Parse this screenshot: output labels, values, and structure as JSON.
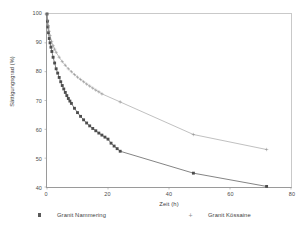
{
  "chart_data": {
    "type": "line",
    "title": "",
    "xlabel": "Zeit (h)",
    "ylabel": "Sättigungsgrad (%)",
    "xlim": [
      0,
      80
    ],
    "ylim": [
      40,
      100
    ],
    "xticks": [
      "0",
      "20",
      "40",
      "60",
      "80"
    ],
    "yticks": [
      "100",
      "90",
      "80",
      "70",
      "60",
      "50",
      "40"
    ],
    "grid": false,
    "legend_position": "below",
    "series": [
      {
        "name": "Granit Nammering",
        "marker": "filled-square",
        "color": "#4d4d4d",
        "x": [
          0,
          0.15,
          0.3,
          0.5,
          0.75,
          1,
          1.3,
          1.6,
          2,
          2.5,
          3,
          3.5,
          4,
          4.5,
          5,
          5.5,
          6,
          6.5,
          7,
          7.5,
          8,
          9,
          10,
          11,
          12,
          13,
          14,
          15,
          16,
          17,
          18,
          19,
          20,
          21,
          22,
          23,
          24,
          48,
          72
        ],
        "y": [
          100,
          97.5,
          95.5,
          93.5,
          91.5,
          90,
          88.5,
          87,
          85,
          83,
          81,
          79.5,
          78,
          76.5,
          75.2,
          74,
          72.8,
          71.7,
          70.7,
          69.8,
          69,
          67.3,
          65.8,
          64.5,
          63.3,
          62.2,
          61.2,
          60.3,
          59.5,
          58.7,
          58,
          57.3,
          56.6,
          55.2,
          54.2,
          53.3,
          52.4,
          44.8,
          40.2
        ]
      },
      {
        "name": "Granit Kössaine",
        "marker": "plus",
        "color": "#8a8a8a",
        "x": [
          0,
          0.2,
          0.4,
          0.7,
          1,
          1.5,
          2,
          2.5,
          3,
          4,
          5,
          6,
          7,
          8,
          9,
          10,
          11,
          12,
          13,
          14,
          15,
          16,
          17,
          18,
          24,
          48,
          72
        ],
        "y": [
          100,
          97.8,
          96,
          94,
          92.5,
          90.5,
          89,
          87.8,
          86.7,
          85,
          83.5,
          82.2,
          81,
          80,
          79,
          78.1,
          77.3,
          76.5,
          75.7,
          75,
          74.3,
          73.6,
          73,
          72.3,
          69.5,
          58.2,
          53.0
        ]
      }
    ]
  },
  "legend": {
    "entries": [
      {
        "label": "Granit Nammering",
        "marker_icon": "filled-square-marker"
      },
      {
        "label": "Granit Kössaine",
        "marker_icon": "plus-marker"
      }
    ]
  }
}
